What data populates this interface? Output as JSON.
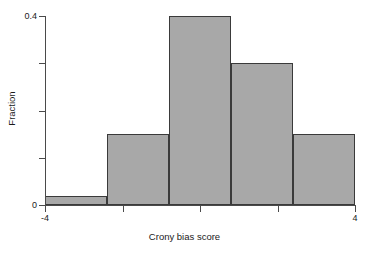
{
  "chart_data": {
    "type": "bar",
    "title": "",
    "subtitle": "",
    "xlabel": "Crony bias score",
    "ylabel": "Fraction",
    "xlim": [
      -4,
      4
    ],
    "ylim": [
      0,
      0.4
    ],
    "grid": false,
    "legend": null,
    "bin_edges": [
      -4,
      -2.4,
      -0.8,
      0.8,
      2.4,
      4
    ],
    "categories": [
      "-4 to -2.4",
      "-2.4 to -0.8",
      "-0.8 to 0.8",
      "0.8 to 2.4",
      "2.4 to 4"
    ],
    "values": [
      0.02,
      0.15,
      0.4,
      0.3,
      0.15
    ],
    "bar_color": "#a8a8a8",
    "bar_edge_color": "#3a3a3a",
    "x_ticks": [
      {
        "value": -4,
        "label": "-4",
        "labeled": true
      },
      {
        "value": -2,
        "label": "",
        "labeled": false
      },
      {
        "value": 0,
        "label": "",
        "labeled": false
      },
      {
        "value": 2,
        "label": "",
        "labeled": false
      },
      {
        "value": 4,
        "label": "4",
        "labeled": true
      }
    ],
    "y_ticks": [
      {
        "value": 0,
        "label": "0",
        "labeled": true
      },
      {
        "value": 0.1,
        "label": "",
        "labeled": false
      },
      {
        "value": 0.2,
        "label": "",
        "labeled": false
      },
      {
        "value": 0.3,
        "label": "",
        "labeled": false
      },
      {
        "value": 0.4,
        "label": "0.4",
        "labeled": true
      }
    ]
  }
}
